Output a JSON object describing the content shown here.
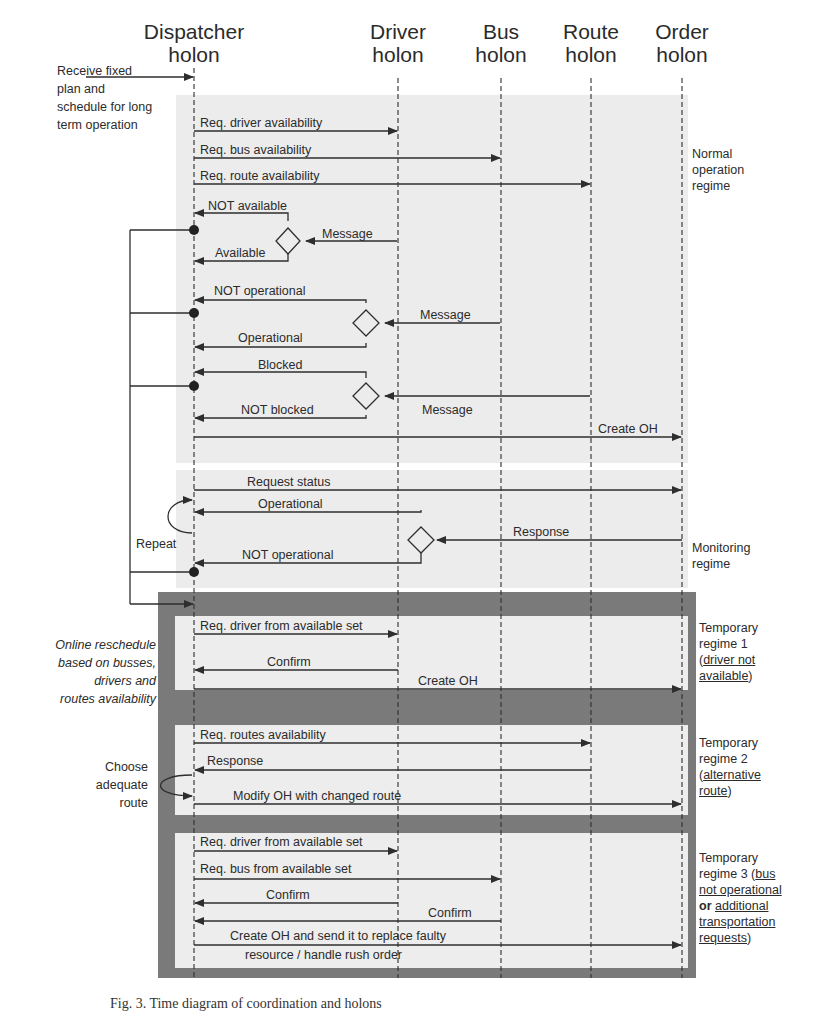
{
  "lifelines": [
    {
      "id": "dispatcher",
      "line1": "Dispatcher",
      "line2": "holon",
      "x": 194
    },
    {
      "id": "driver",
      "line1": "Driver",
      "line2": "holon",
      "x": 398
    },
    {
      "id": "bus",
      "line1": "Bus",
      "line2": "holon",
      "x": 501
    },
    {
      "id": "route",
      "line1": "Route",
      "line2": "holon",
      "x": 591
    },
    {
      "id": "order",
      "line1": "Order",
      "line2": "holon",
      "x": 682
    }
  ],
  "intro_note": {
    "lines": [
      "Receive fixed",
      "plan and",
      "schedule for long",
      "term operation"
    ]
  },
  "regimes": {
    "normal": {
      "label_lines": [
        "Normal",
        "operation",
        "regime"
      ],
      "messages": [
        "Req. driver availability",
        "Req. bus availability",
        "Req. route availability",
        "NOT available",
        "Available",
        "Message",
        "NOT operational",
        "Operational",
        "Message",
        "Blocked",
        "NOT blocked",
        "Message",
        "Create OH"
      ]
    },
    "monitoring": {
      "label_lines": [
        "Monitoring",
        "regime"
      ],
      "repeat_label": "Repeat",
      "messages": [
        "Request status",
        "Operational",
        "Response",
        "NOT operational"
      ]
    },
    "temporary": {
      "note_lines": [
        "Online reschedule",
        "based on busses,",
        "drivers and",
        "routes availability"
      ],
      "regime1": {
        "label_prefix": [
          "Temporary",
          "regime 1"
        ],
        "label_cond": [
          "driver not",
          "available"
        ],
        "messages": [
          "Req. driver from available set",
          "Confirm",
          "Create OH"
        ]
      },
      "regime2": {
        "label_prefix": [
          "Temporary",
          "regime 2"
        ],
        "label_cond": [
          "alternative",
          "route"
        ],
        "choose_note": [
          "Choose",
          "adequate",
          "route"
        ],
        "messages": [
          "Req. routes availability",
          "Response",
          "Modify OH with changed route"
        ]
      },
      "regime3": {
        "label_prefix": [
          "Temporary",
          "regime 3 ("
        ],
        "label_cond_a": "bus",
        "label_cond_b": "not operational",
        "label_or": "or",
        "label_cond_c": "additional",
        "label_cond_d": "transportation",
        "label_cond_e": "requests",
        "messages": [
          "Req. driver from available set",
          "Req. bus from available set",
          "Confirm",
          "Confirm",
          "Create OH and send it to replace faulty",
          "resource / handle rush order"
        ]
      }
    }
  },
  "caption": "Fig. 3.  Time diagram of coordination and holons",
  "colors": {
    "normal_bg": "#ececec",
    "monitor_bg": "#ececec",
    "frame": "#7a7a7a",
    "inner_bg": "#ededed",
    "line": "#2e2e2e"
  }
}
